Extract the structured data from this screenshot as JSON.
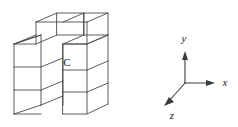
{
  "figure": {
    "background_color": "#ffffff",
    "edge_color": "#4a4a4a",
    "label_color": "#1a1a1a"
  },
  "block": {
    "label_c": "C",
    "description": "stack of unit cubes in oblique projection"
  },
  "axes": {
    "x_label": "x",
    "y_label": "y",
    "z_label": "z"
  }
}
